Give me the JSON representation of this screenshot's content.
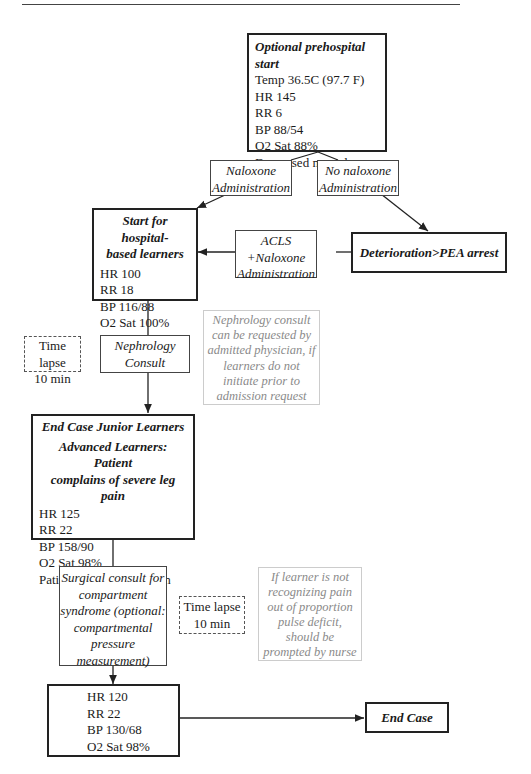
{
  "nodes": {
    "prehospital": {
      "title": "Optional prehospital start",
      "lines": [
        "Temp 36.5C (97.7 F)",
        "HR 145",
        "RR 6",
        "BP 88/54",
        "O2 Sat 88%",
        "Decreased mental status"
      ]
    },
    "naloxone": {
      "lines": [
        "Naloxone",
        "Administration"
      ]
    },
    "no_naloxone": {
      "lines": [
        "No naloxone",
        "Administration"
      ]
    },
    "hospital_start": {
      "title_lines": [
        "Start for hospital-",
        "based learners"
      ],
      "lines": [
        "HR 100",
        "RR 18",
        "BP 116/88",
        "O2 Sat 100%"
      ]
    },
    "acls": {
      "lines": [
        "ACLS",
        "+Naloxone",
        "Administration"
      ]
    },
    "pea": {
      "title": "Deterioration>PEA arrest"
    },
    "time_lapse_1": {
      "lines": [
        "Time lapse",
        "10 min"
      ]
    },
    "nephrology": {
      "lines": [
        "Nephrology",
        "Consult"
      ]
    },
    "nephrology_note": {
      "lines": [
        "Nephrology consult",
        "can be requested by",
        "admitted physician, if",
        "learners do not",
        "initiate prior to",
        "admission request"
      ]
    },
    "end_junior": {
      "title": "End Case Junior Learners",
      "subtitle_lines": [
        "Advanced Learners: Patient",
        "complains of severe leg pain"
      ],
      "lines": [
        "HR 125",
        "RR 22",
        "BP 158/90",
        "O2 Sat 98%",
        "Patient screaming in pain"
      ]
    },
    "surgical": {
      "lines": [
        "Surgical consult for",
        "compartment",
        "syndrome (optional:",
        "compartmental",
        "pressure",
        "measurement)"
      ]
    },
    "time_lapse_2": {
      "lines": [
        "Time lapse",
        "10 min"
      ]
    },
    "nurse_note": {
      "lines": [
        "If learner is not",
        "recognizing pain",
        "out of proportion",
        "pulse deficit,",
        "should be",
        "prompted by nurse"
      ]
    },
    "final_vitals": {
      "lines": [
        "HR 120",
        "RR 22",
        "BP 130/68",
        "O2 Sat 98%"
      ]
    },
    "end_case": {
      "title": "End Case"
    }
  },
  "colors": {
    "line": "#222222",
    "note_text": "#8a8a8a",
    "note_border": "#cccccc"
  }
}
